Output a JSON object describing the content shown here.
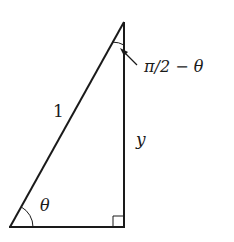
{
  "diagram": {
    "title": "",
    "labels": {
      "hypotenuse": "1",
      "vertical_side": "y",
      "bottom_angle": "θ",
      "top_angle": "π/2 − θ"
    },
    "colors": {
      "stroke": "#1a1a1a",
      "background": "#ffffff"
    }
  }
}
